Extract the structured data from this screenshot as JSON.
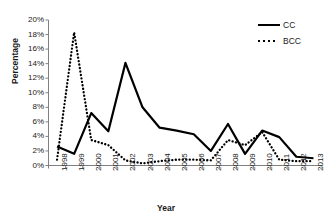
{
  "chart_data": {
    "type": "line",
    "title": "",
    "xlabel": "Year",
    "ylabel": "Percentage",
    "ylim": [
      0,
      20
    ],
    "yticks": [
      0,
      2,
      4,
      6,
      8,
      10,
      12,
      14,
      16,
      18,
      20
    ],
    "ytick_labels": [
      "0%",
      "2%",
      "4%",
      "6%",
      "8%",
      "10%",
      "12%",
      "14%",
      "16%",
      "18%",
      "20%"
    ],
    "grid": false,
    "legend_position": "top-right",
    "categories": [
      "1998",
      "1999",
      "2000",
      "2001",
      "2002",
      "2003",
      "2004",
      "2005",
      "2006",
      "2007",
      "2008",
      "2009",
      "2010",
      "2011",
      "2012",
      "2013"
    ],
    "series": [
      {
        "name": "CC",
        "style": "solid",
        "color": "#000000",
        "values": [
          2.6,
          1.6,
          7.2,
          4.7,
          14.1,
          8.0,
          5.2,
          4.8,
          4.3,
          2.0,
          5.7,
          1.6,
          4.8,
          3.9,
          1.2,
          1.0
        ]
      },
      {
        "name": "BCC",
        "style": "dotted",
        "color": "#000000",
        "values": [
          0.8,
          18.3,
          3.5,
          2.8,
          0.7,
          0.3,
          0.6,
          0.8,
          0.8,
          0.7,
          3.5,
          2.8,
          4.6,
          0.8,
          0.6,
          0.6
        ]
      }
    ]
  },
  "axes": {
    "y_title": "Percentage",
    "x_title": "Year"
  },
  "legend": {
    "entries": [
      {
        "label": "CC",
        "style": "solid"
      },
      {
        "label": "BCC",
        "style": "dotted"
      }
    ]
  }
}
